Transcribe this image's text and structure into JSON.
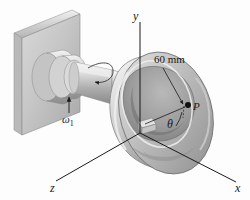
{
  "figure": {
    "type": "engineering-mechanics-diagram",
    "background_color": "#fdfdfd",
    "line_color": "#1a1a1a",
    "metal_light": "#e8e8e8",
    "metal_mid": "#c2c2c2",
    "metal_dark": "#8f8f8f",
    "metal_shadow": "#6e6e6e"
  },
  "axes": {
    "y_label": "y",
    "x_label": "x",
    "z_label": "z"
  },
  "annotations": {
    "dimension": "60 mm",
    "point_label": "P",
    "angle_label": "θ",
    "angular_velocity": "ω",
    "angular_velocity_subscript": "1"
  }
}
